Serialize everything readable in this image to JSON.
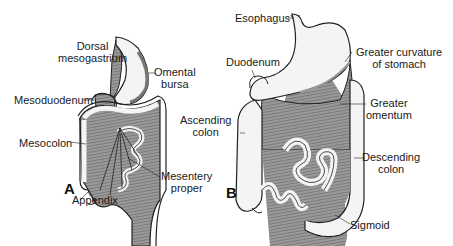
{
  "figure": {
    "panel_a": {
      "letter": "A",
      "labels": {
        "dorsal_mesogastrium_1": "Dorsal",
        "dorsal_mesogastrium_2": "mesogastrium",
        "omental_bursa_1": "Omental",
        "omental_bursa_2": "bursa",
        "mesoduodenum": "Mesoduodenum",
        "mesocolon": "Mesocolon",
        "mesentery_proper_1": "Mesentery",
        "mesentery_proper_2": "proper",
        "appendix": "Appendix"
      }
    },
    "panel_b": {
      "letter": "B",
      "labels": {
        "esophagus": "Esophagus",
        "duodenum": "Duodenum",
        "greater_curvature_1": "Greater curvature",
        "greater_curvature_2": "of stomach",
        "ascending_colon_1": "Ascending",
        "ascending_colon_2": "colon",
        "greater_omentum_1": "Greater",
        "greater_omentum_2": "omentum",
        "descending_colon_1": "Descending",
        "descending_colon_2": "colon",
        "sigmoid": "Sigmoid"
      }
    },
    "colors": {
      "shade": "#8a8a8a",
      "dark": "#555555",
      "outline": "#222222",
      "organ": "#f4f4f4"
    }
  }
}
